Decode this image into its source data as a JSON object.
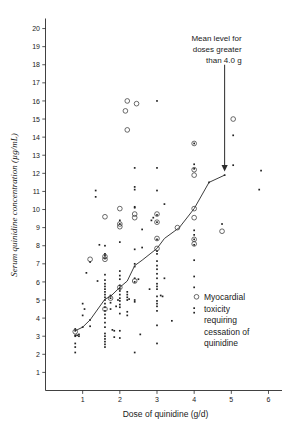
{
  "chart_data": {
    "type": "scatter",
    "title": "",
    "xlabel": "Dose of quinidine (g/d)",
    "ylabel": "Serum quinidine concentration (µg/mL)",
    "xlim": [
      0,
      6.35
    ],
    "ylim": [
      0,
      20.5
    ],
    "xticks": [
      1,
      2,
      3,
      4,
      5,
      6
    ],
    "yticks": [
      1,
      2,
      3,
      4,
      5,
      6,
      7,
      8,
      9,
      10,
      11,
      12,
      13,
      14,
      15,
      16,
      17,
      18,
      19,
      20
    ],
    "grid": false,
    "legend_position": "inside-right-lower",
    "annotations": [
      {
        "name": "mean-level-annotation",
        "lines": [
          "Mean level for",
          "doses greater",
          "than 4.0 g"
        ],
        "arrow_from": [
          4.82,
          18.0
        ],
        "arrow_to": [
          4.82,
          12.1
        ]
      }
    ],
    "legend": [
      {
        "marker": "open-circle",
        "lines": [
          "Myocardial",
          "toxicity",
          "requiring",
          "cessation of",
          "quinidine"
        ]
      }
    ],
    "series": [
      {
        "name": "Mean level line",
        "type": "line",
        "marker": "none",
        "points": [
          [
            0.8,
            3.3
          ],
          [
            1.0,
            3.5
          ],
          [
            1.2,
            3.9
          ],
          [
            1.6,
            5.05
          ],
          [
            1.75,
            5.2
          ],
          [
            2.0,
            5.7
          ],
          [
            2.2,
            6.05
          ],
          [
            2.4,
            6.9
          ],
          [
            2.6,
            7.2
          ],
          [
            3.0,
            7.85
          ],
          [
            3.2,
            8.4
          ],
          [
            3.6,
            9.0
          ],
          [
            4.0,
            10.05
          ],
          [
            4.4,
            11.5
          ],
          [
            4.82,
            11.9
          ]
        ]
      },
      {
        "name": "Serum level (no toxicity)",
        "type": "scatter",
        "marker": "dot",
        "points": [
          [
            0.8,
            2.1
          ],
          [
            0.8,
            2.4
          ],
          [
            0.8,
            2.6
          ],
          [
            0.8,
            3.0
          ],
          [
            0.8,
            3.05
          ],
          [
            0.8,
            3.3
          ],
          [
            0.8,
            3.4
          ],
          [
            0.85,
            3.05
          ],
          [
            0.9,
            3.0
          ],
          [
            0.9,
            3.1
          ],
          [
            1.0,
            4.15
          ],
          [
            1.0,
            4.8
          ],
          [
            1.0,
            3.5
          ],
          [
            1.05,
            4.5
          ],
          [
            1.1,
            6.5
          ],
          [
            1.2,
            3.55
          ],
          [
            1.2,
            3.9
          ],
          [
            1.2,
            7.1
          ],
          [
            1.35,
            11.05
          ],
          [
            1.35,
            10.7
          ],
          [
            1.4,
            6.05
          ],
          [
            1.45,
            8.05
          ],
          [
            1.6,
            2.4
          ],
          [
            1.6,
            2.55
          ],
          [
            1.6,
            2.7
          ],
          [
            1.6,
            2.85
          ],
          [
            1.6,
            3.0
          ],
          [
            1.6,
            3.15
          ],
          [
            1.6,
            3.5
          ],
          [
            1.6,
            3.75
          ],
          [
            1.6,
            4.0
          ],
          [
            1.6,
            4.2
          ],
          [
            1.6,
            4.4
          ],
          [
            1.6,
            4.6
          ],
          [
            1.6,
            4.8
          ],
          [
            1.6,
            5.0
          ],
          [
            1.6,
            5.15
          ],
          [
            1.6,
            5.3
          ],
          [
            1.6,
            5.45
          ],
          [
            1.6,
            5.6
          ],
          [
            1.6,
            5.75
          ],
          [
            1.6,
            5.9
          ],
          [
            1.6,
            6.1
          ],
          [
            1.6,
            6.4
          ],
          [
            1.6,
            7.3
          ],
          [
            1.6,
            7.45
          ],
          [
            1.6,
            7.55
          ],
          [
            1.6,
            8.0
          ],
          [
            1.75,
            4.5
          ],
          [
            1.75,
            4.85
          ],
          [
            1.75,
            5.1
          ],
          [
            1.75,
            5.25
          ],
          [
            1.8,
            3.35
          ],
          [
            1.85,
            2.95
          ],
          [
            1.85,
            3.3
          ],
          [
            1.9,
            4.65
          ],
          [
            1.95,
            5.0
          ],
          [
            2.0,
            2.9
          ],
          [
            2.0,
            3.3
          ],
          [
            2.0,
            4.25
          ],
          [
            2.0,
            4.6
          ],
          [
            2.0,
            4.75
          ],
          [
            2.0,
            4.95
          ],
          [
            2.0,
            5.1
          ],
          [
            2.0,
            5.3
          ],
          [
            2.0,
            5.5
          ],
          [
            2.0,
            5.65
          ],
          [
            2.0,
            5.8
          ],
          [
            2.0,
            6.15
          ],
          [
            2.0,
            6.35
          ],
          [
            2.0,
            6.6
          ],
          [
            2.0,
            8.2
          ],
          [
            2.0,
            9.2
          ],
          [
            2.0,
            9.4
          ],
          [
            2.2,
            4.15
          ],
          [
            2.2,
            4.35
          ],
          [
            2.2,
            5.0
          ],
          [
            2.2,
            5.15
          ],
          [
            2.2,
            5.3
          ],
          [
            2.2,
            5.45
          ],
          [
            2.25,
            5.05
          ],
          [
            2.4,
            2.1
          ],
          [
            2.4,
            4.9
          ],
          [
            2.4,
            5.0
          ],
          [
            2.4,
            6.0
          ],
          [
            2.4,
            6.2
          ],
          [
            2.4,
            6.85
          ],
          [
            2.4,
            7.0
          ],
          [
            2.4,
            7.8
          ],
          [
            2.4,
            10.1
          ],
          [
            2.4,
            10.15
          ],
          [
            2.4,
            11.1
          ],
          [
            2.4,
            11.25
          ],
          [
            2.4,
            12.3
          ],
          [
            2.5,
            6.15
          ],
          [
            2.55,
            3.1
          ],
          [
            2.6,
            7.9
          ],
          [
            2.6,
            8.9
          ],
          [
            2.8,
            5.6
          ],
          [
            2.85,
            9.4
          ],
          [
            2.9,
            9.55
          ],
          [
            3.0,
            2.6
          ],
          [
            3.0,
            3.6
          ],
          [
            3.0,
            4.4
          ],
          [
            3.0,
            4.65
          ],
          [
            3.0,
            4.8
          ],
          [
            3.0,
            4.95
          ],
          [
            3.0,
            5.2
          ],
          [
            3.0,
            5.6
          ],
          [
            3.0,
            5.75
          ],
          [
            3.0,
            5.9
          ],
          [
            3.0,
            6.2
          ],
          [
            3.0,
            6.45
          ],
          [
            3.0,
            6.7
          ],
          [
            3.0,
            6.9
          ],
          [
            3.0,
            7.15
          ],
          [
            3.0,
            7.55
          ],
          [
            3.0,
            7.7
          ],
          [
            3.0,
            8.35
          ],
          [
            3.0,
            9.3
          ],
          [
            3.0,
            9.7
          ],
          [
            3.0,
            11.05
          ],
          [
            3.0,
            12.3
          ],
          [
            3.0,
            16.0
          ],
          [
            3.1,
            5.25
          ],
          [
            3.15,
            5.2
          ],
          [
            3.2,
            6.2
          ],
          [
            3.2,
            10.3
          ],
          [
            3.4,
            3.85
          ],
          [
            4.0,
            4.3
          ],
          [
            4.0,
            4.55
          ],
          [
            4.0,
            5.7
          ],
          [
            4.0,
            6.3
          ],
          [
            4.0,
            7.2
          ],
          [
            4.0,
            8.05
          ],
          [
            4.0,
            8.35
          ],
          [
            4.0,
            8.6
          ],
          [
            4.0,
            8.85
          ],
          [
            4.0,
            12.25
          ],
          [
            4.0,
            12.5
          ],
          [
            4.0,
            13.65
          ],
          [
            4.4,
            11.5
          ],
          [
            4.75,
            9.2
          ],
          [
            4.82,
            11.9
          ],
          [
            5.05,
            12.45
          ],
          [
            5.05,
            14.1
          ],
          [
            5.75,
            11.1
          ],
          [
            5.8,
            12.15
          ]
        ]
      },
      {
        "name": "Myocardial toxicity requiring cessation of quinidine",
        "type": "scatter",
        "marker": "open-circle",
        "points": [
          [
            0.8,
            3.25
          ],
          [
            1.2,
            7.25
          ],
          [
            1.6,
            4.5
          ],
          [
            1.6,
            7.25
          ],
          [
            1.6,
            7.4
          ],
          [
            1.6,
            9.6
          ],
          [
            1.75,
            5.1
          ],
          [
            2.0,
            5.7
          ],
          [
            2.0,
            9.05
          ],
          [
            2.0,
            9.2
          ],
          [
            2.0,
            10.05
          ],
          [
            2.15,
            15.45
          ],
          [
            2.2,
            14.4
          ],
          [
            2.2,
            16.0
          ],
          [
            2.4,
            6.05
          ],
          [
            2.4,
            9.55
          ],
          [
            2.4,
            9.75
          ],
          [
            2.45,
            15.85
          ],
          [
            3.0,
            7.85
          ],
          [
            3.0,
            8.4
          ],
          [
            3.0,
            9.3
          ],
          [
            3.0,
            9.75
          ],
          [
            3.55,
            9.0
          ],
          [
            4.0,
            8.1
          ],
          [
            4.0,
            8.35
          ],
          [
            4.0,
            9.55
          ],
          [
            4.0,
            10.05
          ],
          [
            4.0,
            11.9
          ],
          [
            4.0,
            12.2
          ],
          [
            4.0,
            13.65
          ],
          [
            4.75,
            8.8
          ],
          [
            5.05,
            15.0
          ]
        ]
      }
    ]
  }
}
